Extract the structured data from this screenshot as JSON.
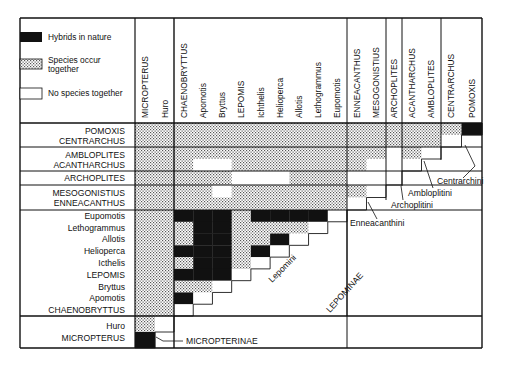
{
  "figure": {
    "colors": {
      "hybrid": "#111111",
      "sympatric": "stipple",
      "none": "#ffffff",
      "line": "#1a1a1a"
    }
  },
  "legend": {
    "items": [
      {
        "key": "hybrid",
        "label": "Hybrids in nature"
      },
      {
        "key": "sympatric",
        "label_line1": "Species occur",
        "label_line2": "together"
      },
      {
        "key": "none",
        "label": "No species together"
      }
    ]
  },
  "columns": [
    {
      "id": "MICROPTERUS",
      "label": "MICROPTERUS",
      "group": "Micropterinae"
    },
    {
      "id": "Huro",
      "label": "Huro",
      "group": "Micropterinae"
    },
    {
      "id": "CHAENOBRYTTUS",
      "label": "CHAENOBRYTTUS",
      "group": "Lepomini"
    },
    {
      "id": "Apomotis",
      "label": "Apomotis",
      "group": "Lepomini"
    },
    {
      "id": "Bryttus",
      "label": "Bryttus",
      "group": "Lepomini"
    },
    {
      "id": "LEPOMIS",
      "label": "LEPOMIS",
      "group": "Lepomini"
    },
    {
      "id": "Icthelis",
      "label": "Ichthelis",
      "group": "Lepomini"
    },
    {
      "id": "Helioperca",
      "label": "Helioperca",
      "group": "Lepomini"
    },
    {
      "id": "Allotis",
      "label": "Allotis",
      "group": "Lepomini"
    },
    {
      "id": "Lethogrammus",
      "label": "Lethogrammus",
      "group": "Lepomini"
    },
    {
      "id": "Eupomotis",
      "label": "Eupomotis",
      "group": "Lepomini"
    },
    {
      "id": "ENNEACANTHUS",
      "label": "ENNEACANTHUS",
      "group": "Enneacanthini"
    },
    {
      "id": "MESOGONISTIUS",
      "label": "MESOGONISTIUS",
      "group": "Enneacanthini"
    },
    {
      "id": "ARCHOPLITES",
      "label": "ARCHOPLITES",
      "group": "Archoplitini"
    },
    {
      "id": "ACANTHARCHUS",
      "label": "ACANTHARCHUS",
      "group": "Amblopitini"
    },
    {
      "id": "AMBLOPLITES",
      "label": "AMBLOPLITES",
      "group": "Amblopitini"
    },
    {
      "id": "CENTRARCHUS",
      "label": "CENTRARCHUS",
      "group": "Centrarchini"
    },
    {
      "id": "POMOXIS",
      "label": "POMOXIS",
      "group": "Centrarchini"
    }
  ],
  "row_groups": [
    {
      "rows": [
        "POMOXIS",
        "CENTRARCHUS"
      ]
    },
    {
      "rows": [
        "AMBLOPLITES",
        "ACANTHARCHUS"
      ]
    },
    {
      "rows": [
        "ARCHOPLITES"
      ]
    },
    {
      "rows": [
        "MESOGONISTIUS",
        "ENNEACANTHUS"
      ]
    },
    {
      "rows": [
        "Eupomotis",
        "Lethogrammus",
        "Allotis",
        "Helioperca",
        "Icthelis",
        "LEPOMIS",
        "Bryttus",
        "Apomotis",
        "CHAENOBRYTTUS"
      ]
    },
    {
      "rows": [
        "Huro",
        "MICROPTERUS"
      ]
    }
  ],
  "annotations": {
    "centrarchini": "Centrarchini",
    "amblopitini": "Ambloplitini",
    "archoplitini": "Archoplitini",
    "enneacanthini": "Enneacanthini",
    "lepomini": "Lepomini",
    "lepominae": "LEPOMINAE",
    "micropterinae": "MICROPTERINAE"
  },
  "matrix_rows": {
    "POMOXIS": "SSSSSSSSSSSSSSSSSH",
    "CENTRARCHUS": "SSSSSSSSSSSSSSSSW-",
    "AMBLOPLITES": "SSSSSSSSSSSSSWSW--",
    "ACANTHARCHUS": "SSSWWSSSSSSSWWW---",
    "ARCHOPLITES": "SSSSSWWWSSSWWW----",
    "MESOGONISTIUS": "SSSSWSSSSSSSW-----",
    "ENNEACANTHUS": "SSSSSSSSSSSW------",
    "Eupomotis": "SSHHHSHHHHW-------",
    "Lethogrammus": "SSSHHSSSSW--------",
    "Allotis": "SSSHHSSHW---------",
    "Helioperca": "SSHHHSHW----------",
    "Icthelis": "SSSHHSW-----------",
    "LEPOMIS": "SSHHHW------------",
    "Bryttus": "SSSSW-------------",
    "Apomotis": "SSHW--------------",
    "CHAENOBRYTTUS": "SSW---------------",
    "Huro": "SW----------------",
    "MICROPTERUS": "H-----------------"
  }
}
